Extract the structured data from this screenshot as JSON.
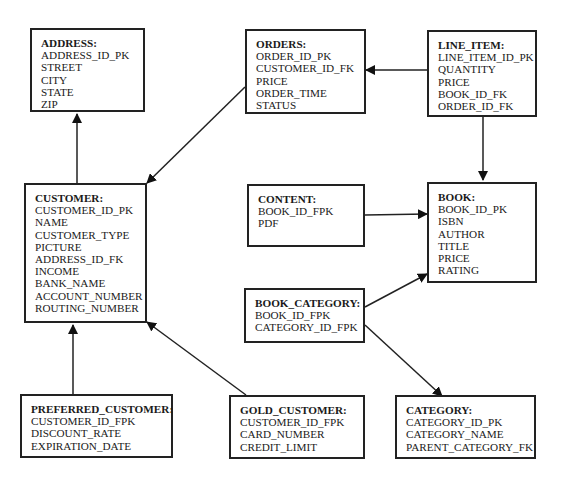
{
  "diagram": {
    "type": "entity-relationship",
    "entities": {
      "address": {
        "title": "ADDRESS:",
        "attributes": [
          "ADDRESS_ID_PK",
          "STREET",
          "CITY",
          "STATE",
          "ZIP"
        ]
      },
      "orders": {
        "title": "ORDERS:",
        "attributes": [
          "ORDER_ID_PK",
          "CUSTOMER_ID_FK",
          "PRICE",
          "ORDER_TIME",
          "STATUS"
        ]
      },
      "line_item": {
        "title": "LINE_ITEM:",
        "attributes": [
          "LINE_ITEM_ID_PK",
          "QUANTITY",
          "PRICE",
          "BOOK_ID_FK",
          "ORDER_ID_FK"
        ]
      },
      "customer": {
        "title": "CUSTOMER:",
        "attributes": [
          "CUSTOMER_ID_PK",
          "NAME",
          "CUSTOMER_TYPE",
          "PICTURE",
          "ADDRESS_ID_FK",
          "INCOME",
          "BANK_NAME",
          "ACCOUNT_NUMBER",
          "ROUTING_NUMBER"
        ]
      },
      "content": {
        "title": "CONTENT:",
        "attributes": [
          "BOOK_ID_FPK",
          "PDF"
        ]
      },
      "book": {
        "title": "BOOK:",
        "attributes": [
          "BOOK_ID_PK",
          "ISBN",
          "AUTHOR",
          "TITLE",
          "PRICE",
          "RATING"
        ]
      },
      "book_category": {
        "title": "BOOK_CATEGORY:",
        "attributes": [
          "BOOK_ID_FPK",
          "CATEGORY_ID_FPK"
        ]
      },
      "preferred_customer": {
        "title": "PREFERRED_CUSTOMER:",
        "attributes": [
          "CUSTOMER_ID_FPK",
          "DISCOUNT_RATE",
          "EXPIRATION_DATE"
        ]
      },
      "gold_customer": {
        "title": "GOLD_CUSTOMER:",
        "attributes": [
          "CUSTOMER_ID_FPK",
          "CARD_NUMBER",
          "CREDIT_LIMIT"
        ]
      },
      "category": {
        "title": "CATEGORY:",
        "attributes": [
          "CATEGORY_ID_PK",
          "CATEGORY_NAME",
          "PARENT_CATEGORY_FK"
        ]
      }
    },
    "relationships": [
      {
        "from": "customer",
        "to": "address"
      },
      {
        "from": "orders",
        "to": "customer"
      },
      {
        "from": "line_item",
        "to": "orders"
      },
      {
        "from": "line_item",
        "to": "book"
      },
      {
        "from": "content",
        "to": "book"
      },
      {
        "from": "book_category",
        "to": "book"
      },
      {
        "from": "book_category",
        "to": "category"
      },
      {
        "from": "preferred_customer",
        "to": "customer"
      },
      {
        "from": "gold_customer",
        "to": "customer"
      }
    ],
    "colors": {
      "line": "#222222",
      "background": "#ffffff",
      "text": "#1a1a1a"
    }
  }
}
